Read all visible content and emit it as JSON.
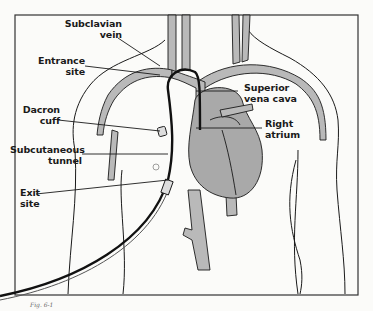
{
  "diagram": {
    "labels": {
      "subclavian_vein": [
        "Subclavian",
        "vein"
      ],
      "entrance_site": [
        "Entrance",
        "site"
      ],
      "dacron_cuff": [
        "Dacron",
        "cuff"
      ],
      "subcutaneous_tunnel": [
        "Subcutaneous",
        "tunnel"
      ],
      "exit_site": [
        "Exit",
        "site"
      ],
      "superior_vena_cava": [
        "Superior",
        "vena cava"
      ],
      "right_atrium": [
        "Right",
        "atrium"
      ]
    },
    "caption": "Fig. 6-1",
    "colors": {
      "vessel_fill": "#b9b9b9",
      "heart_fill": "#a9a9a9",
      "line": "#1a1a1a",
      "catheter": "#111111",
      "background": "#fbfbf9"
    }
  }
}
